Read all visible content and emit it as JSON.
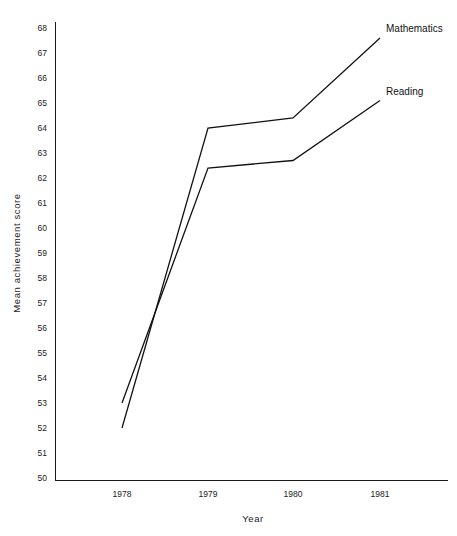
{
  "chart_data": {
    "type": "line",
    "title": "",
    "xlabel": "Year",
    "ylabel": "Mean achievement score",
    "categories": [
      "1978",
      "1979",
      "1980",
      "1981"
    ],
    "x": [
      1978,
      1979,
      1980,
      1981
    ],
    "xlim": [
      1977.6,
      1981.8
    ],
    "ylim": [
      50,
      68
    ],
    "yticks": [
      50,
      51,
      52,
      53,
      54,
      55,
      56,
      57,
      58,
      59,
      60,
      61,
      62,
      63,
      64,
      65,
      66,
      67,
      68
    ],
    "ytick_labels": [
      "50",
      "51",
      "52",
      "53",
      "54",
      "55",
      "56",
      "57",
      "58",
      "59",
      "60",
      "61",
      "62",
      "63",
      "64",
      "65",
      "66",
      "67",
      "68"
    ],
    "grid": false,
    "legend_position": "inline-end-labels",
    "series": [
      {
        "name": "Mathematics",
        "values": [
          52.0,
          64.0,
          64.4,
          67.6
        ],
        "label": "Mathematics"
      },
      {
        "name": "Reading",
        "values": [
          53.0,
          62.4,
          62.7,
          65.1
        ],
        "label": "Reading"
      }
    ],
    "annotations": [
      {
        "text": "Mathematics",
        "x": 1981,
        "y": 67.6
      },
      {
        "text": "Reading",
        "x": 1981,
        "y": 65.1
      }
    ]
  },
  "axis": {
    "y_title": "Mean achievement score",
    "x_title": "Year"
  }
}
